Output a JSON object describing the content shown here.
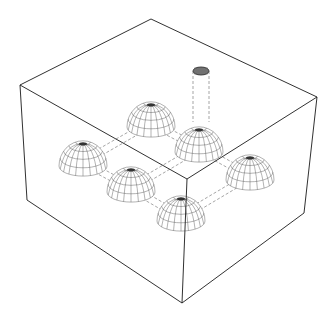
{
  "diagram": {
    "title": "",
    "colors": {
      "background": "#ffffff",
      "edge": "#1a1a1a",
      "hidden_line": "#6a6a6a",
      "mesh": "#555555"
    },
    "block": {
      "top_face": [
        [
          20,
          85
        ],
        [
          151,
          19
        ],
        [
          317,
          97
        ],
        [
          187,
          179
        ]
      ],
      "bottom_vertices": {
        "left": [
          27,
          200
        ],
        "front": [
          182,
          303
        ],
        "right": [
          304,
          213
        ]
      }
    },
    "hemispheres": [
      {
        "id": "back-center",
        "cx": 151,
        "base_y": 127,
        "r": 24
      },
      {
        "id": "back-right",
        "cx": 199,
        "base_y": 152,
        "r": 24
      },
      {
        "id": "right",
        "cx": 250,
        "base_y": 180,
        "r": 24
      },
      {
        "id": "left",
        "cx": 83,
        "base_y": 166,
        "r": 24
      },
      {
        "id": "front-left",
        "cx": 131,
        "base_y": 192,
        "r": 24
      },
      {
        "id": "front",
        "cx": 181,
        "base_y": 221,
        "r": 24
      }
    ],
    "cylinder": {
      "cx": 201,
      "top_y": 71,
      "bottom_y": 122,
      "rx": 8,
      "ry": 4
    },
    "labels": []
  }
}
